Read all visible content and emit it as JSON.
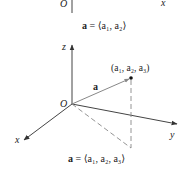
{
  "top_diagram": {
    "origin_label": "O",
    "x_axis_label": "x",
    "caption_bold": "a",
    "caption_rest": " = ⟨a₁, a₂⟩"
  },
  "diagram_3d": {
    "z_axis_label": "z",
    "x_axis_label": "x",
    "y_axis_label": "y",
    "origin_label": "O",
    "vector_label": "a",
    "point_label": "(a₁, a₂, a₃)",
    "caption_bold": "a",
    "caption_rest": " = ⟨a₁, a₂, a₃⟩"
  },
  "colors": {
    "axis": "#444444",
    "vector": "#777777",
    "dashed": "#888888",
    "text": "#222222"
  }
}
